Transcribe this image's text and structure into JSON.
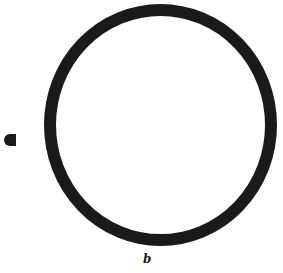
{
  "figure": {
    "label": "b",
    "colors": {
      "ink": "#1a1a1a",
      "background": "#ffffff"
    },
    "ring": {
      "cx": 160.5,
      "cy": 125,
      "rx": 110.5,
      "ry": 115,
      "stroke_width": 12
    },
    "marker": {
      "shape": "half-disc",
      "x": 4,
      "y": 134,
      "width": 12,
      "height": 12
    }
  }
}
